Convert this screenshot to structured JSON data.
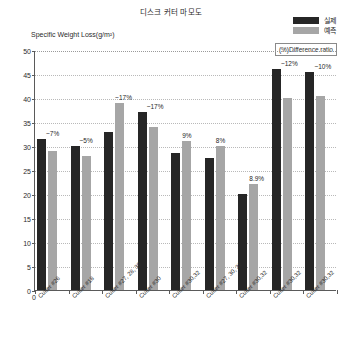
{
  "chart_title": "디스크 커터 마모도",
  "legend": {
    "items": [
      {
        "label": "실제",
        "color": "#262626",
        "name": "actual"
      },
      {
        "label": "예측",
        "color": "#a6a6a6",
        "name": "predicted"
      }
    ]
  },
  "y_axis_title": "Specific Weight Loss(g/m²)",
  "difference_ratio_label": "(%)Difference ratio",
  "x_origin_label": "0",
  "chart_data": {
    "type": "bar",
    "title": "디스크 커터 마모도",
    "xlabel": "",
    "ylabel": "Specific Weight Loss(g/m²)",
    "ylim": [
      0,
      50
    ],
    "ytick_step": 5,
    "yticks": [
      "0",
      "5",
      "10",
      "15",
      "20",
      "25",
      "30",
      "35",
      "40",
      "45",
      "50"
    ],
    "grid": true,
    "legend_position": "top-right",
    "categories": [
      "Cutter #26",
      "Cutter #18",
      "Cutter #27, 28, 30",
      "Cutter #30",
      "Cutter #30,32",
      "Cutter #27, 30, 32",
      "Cutter #30,32",
      "Cutter #30,32",
      "Cutter #30,32"
    ],
    "series": [
      {
        "name": "실제",
        "color": "#262626",
        "values": [
          31.5,
          30.0,
          33.0,
          37.0,
          28.5,
          27.5,
          20.0,
          46.0,
          45.5
        ]
      },
      {
        "name": "예측",
        "color": "#a6a6a6",
        "values": [
          29.0,
          28.0,
          39.0,
          34.0,
          31.0,
          30.0,
          22.0,
          40.0,
          40.5
        ]
      }
    ],
    "annotations": [
      {
        "text": "~7%",
        "group": 0
      },
      {
        "text": "~5%",
        "group": 1
      },
      {
        "text": "~17%",
        "group": 2
      },
      {
        "text": "~17%",
        "group": 3
      },
      {
        "text": "9%",
        "group": 4
      },
      {
        "text": "8%",
        "group": 5
      },
      {
        "text": "8.9%",
        "group": 6
      },
      {
        "text": "~12%",
        "group": 7
      },
      {
        "text": "~10%",
        "group": 8
      }
    ]
  }
}
